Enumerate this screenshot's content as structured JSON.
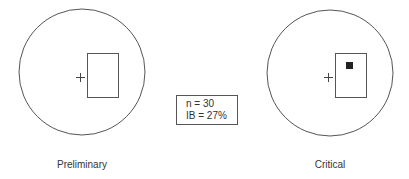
{
  "diagram": {
    "panels": [
      {
        "label": "Preliminary",
        "has_marker": false
      },
      {
        "label": "Critical",
        "has_marker": true
      }
    ],
    "stats": {
      "n_line": "n = 30",
      "ib_line": "IB = 27%"
    },
    "colors": {
      "stroke": "#555555",
      "marker": "#222222"
    }
  }
}
